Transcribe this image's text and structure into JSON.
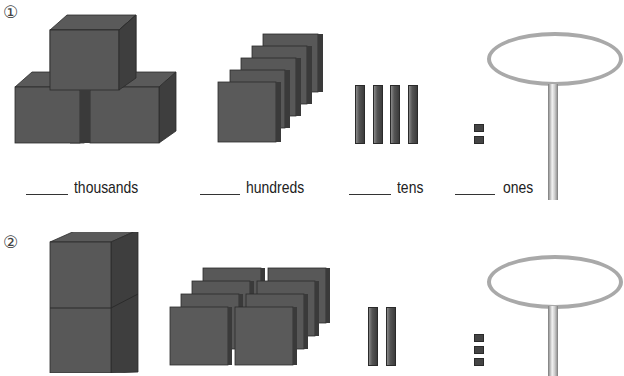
{
  "worksheet": {
    "problems": [
      {
        "number": "①",
        "blocks": {
          "thousands": 3,
          "hundreds": 5,
          "tens": 4,
          "ones": 2
        },
        "labels": {
          "thousands": "thousands",
          "hundreds": "hundreds",
          "tens": "tens",
          "ones": "ones"
        }
      },
      {
        "number": "②",
        "blocks": {
          "thousands": 2,
          "hundreds": 8,
          "tens": 2,
          "ones": 3
        },
        "labels": {}
      }
    ]
  },
  "colors": {
    "block": "#555555",
    "block_dark": "#3f3f3f",
    "block_light": "#666666",
    "hoop": "#a9a9a9"
  }
}
